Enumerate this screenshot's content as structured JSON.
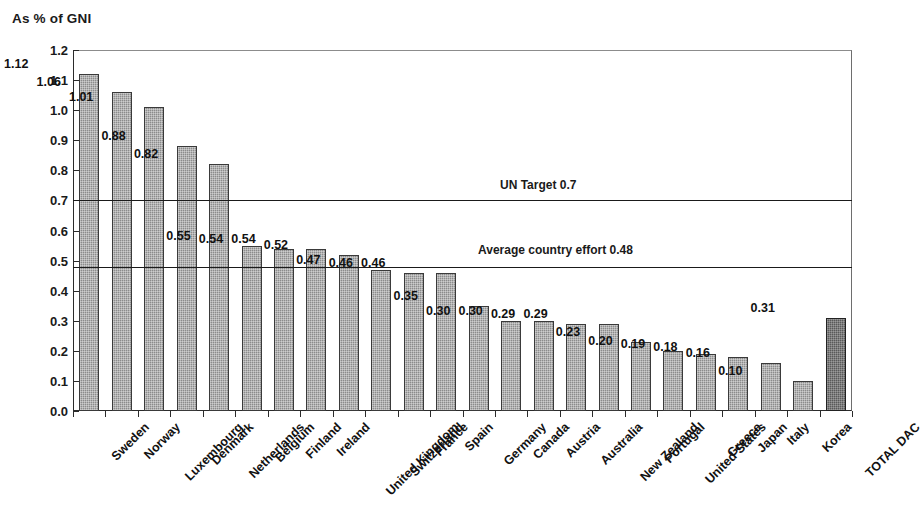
{
  "chart_data": {
    "type": "bar",
    "title": "As % of GNI",
    "xlabel": "",
    "ylabel": "",
    "ylim": [
      0.0,
      1.2
    ],
    "ytick_step": 0.1,
    "grid": false,
    "legend": "none",
    "categories": [
      "Sweden",
      "Norway",
      "Luxembourg",
      "Denmark",
      "Netherlands",
      "Belgium",
      "Finland",
      "Ireland",
      "United Kingdom",
      "Switzerland",
      "France",
      "Spain",
      "Germany",
      "Canada",
      "Austria",
      "Australia",
      "New Zealand",
      "Portugal",
      "United States",
      "Greece",
      "Japan",
      "Italy",
      "Korea",
      "TOTAL DAC"
    ],
    "values": [
      1.12,
      1.06,
      1.01,
      0.88,
      0.82,
      0.55,
      0.54,
      0.54,
      0.52,
      0.47,
      0.46,
      0.46,
      0.35,
      0.3,
      0.3,
      0.29,
      0.29,
      0.23,
      0.2,
      0.19,
      0.18,
      0.16,
      0.1,
      0.31
    ],
    "value_labels": [
      "1.12",
      "1.06",
      "1.01",
      "0.88",
      "0.82",
      "0.55",
      "0.54",
      "0.54",
      "0.52",
      "0.47",
      "0.46",
      "0.46",
      "0.35",
      "0.30",
      "0.30",
      "0.29",
      "0.29",
      "0.23",
      "0.20",
      "0.19",
      "0.18",
      "0.16",
      "0.10",
      "0.31"
    ],
    "highlight_index": 23,
    "ytick_labels": [
      "0.0",
      "0.1",
      "0.2",
      "0.3",
      "0.4",
      "0.5",
      "0.6",
      "0.7",
      "0.8",
      "0.9",
      "1.0",
      "1.1",
      "1.2"
    ],
    "ytick_values": [
      0.0,
      0.1,
      0.2,
      0.3,
      0.4,
      0.5,
      0.6,
      0.7,
      0.8,
      0.9,
      1.0,
      1.1,
      1.2
    ],
    "reference_lines": [
      {
        "label": "UN Target 0.7",
        "value": 0.7
      },
      {
        "label": "Average country effort 0.48",
        "value": 0.48
      }
    ],
    "colors": {
      "bar": "#8c8c8c",
      "bar_highlight": "#5a5a5a",
      "bar_border": "#3a3a3a",
      "axis": "#2b2b2b",
      "text": "#111111",
      "background": "#ffffff"
    }
  }
}
